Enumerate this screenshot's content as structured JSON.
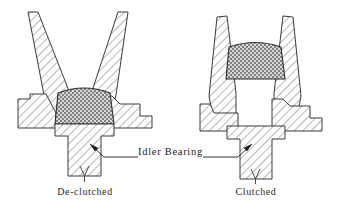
{
  "figure": {
    "type": "mechanical-cross-section",
    "background_color": "#ffffff",
    "line_color": "#3a3a3a",
    "hatch_color": "#4a4a4a",
    "bearing_fill_color": "#b8b8b8",
    "text_color": "#2b2b2b"
  },
  "callout": {
    "label": "Idler  Bearing",
    "has_left_leader": true,
    "has_right_leader": true,
    "left_arrow_target": "left-shaft",
    "right_arrow_target": "right-shaft"
  },
  "views": [
    {
      "id": "left",
      "caption": "De-clutched",
      "state": "de-clutched",
      "arm_configuration": "splayed-open",
      "bearing_position": "low",
      "bearing_label": "idler-bearing"
    },
    {
      "id": "right",
      "caption": "Clutched",
      "state": "clutched",
      "arm_configuration": "closed-vertical",
      "bearing_position": "raised",
      "bearing_label": "idler-bearing"
    }
  ]
}
